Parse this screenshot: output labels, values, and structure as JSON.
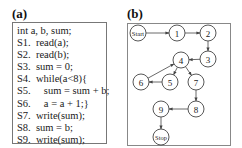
{
  "panel_a": {
    "label": "(a)",
    "code_lines": [
      "int a, b, sum;",
      "S1.  read(a);",
      "S2.  read(b);",
      "S3.  sum = 0;",
      "S4.  while(a<8){",
      "S5.     sum = sum + b;",
      "S6.     a = a + 1;}",
      "S7.  write(sum);",
      "S8.  sum = b;",
      "S9.  write(sum);"
    ]
  },
  "panel_b": {
    "label": "(b)",
    "nodes": [
      {
        "id": "start",
        "label": "Start",
        "x": 138,
        "y": 33
      },
      {
        "id": "1",
        "label": "1",
        "x": 177,
        "y": 33
      },
      {
        "id": "2",
        "label": "2",
        "x": 208,
        "y": 33
      },
      {
        "id": "3",
        "label": "3",
        "x": 208,
        "y": 59
      },
      {
        "id": "4",
        "label": "4",
        "x": 181,
        "y": 60
      },
      {
        "id": "5",
        "label": "5",
        "x": 170,
        "y": 82
      },
      {
        "id": "6",
        "label": "6",
        "x": 141,
        "y": 82
      },
      {
        "id": "7",
        "label": "7",
        "x": 196,
        "y": 82
      },
      {
        "id": "8",
        "label": "8",
        "x": 196,
        "y": 109
      },
      {
        "id": "9",
        "label": "9",
        "x": 161,
        "y": 109
      },
      {
        "id": "stop",
        "label": "Stop",
        "x": 161,
        "y": 137
      }
    ],
    "edges": [
      {
        "from": "start",
        "to": "1"
      },
      {
        "from": "1",
        "to": "2"
      },
      {
        "from": "2",
        "to": "3"
      },
      {
        "from": "3",
        "to": "4"
      },
      {
        "from": "4",
        "to": "5"
      },
      {
        "from": "5",
        "to": "6"
      },
      {
        "from": "6",
        "to": "4"
      },
      {
        "from": "4",
        "to": "7"
      },
      {
        "from": "7",
        "to": "8"
      },
      {
        "from": "8",
        "to": "9"
      },
      {
        "from": "9",
        "to": "stop"
      }
    ]
  }
}
